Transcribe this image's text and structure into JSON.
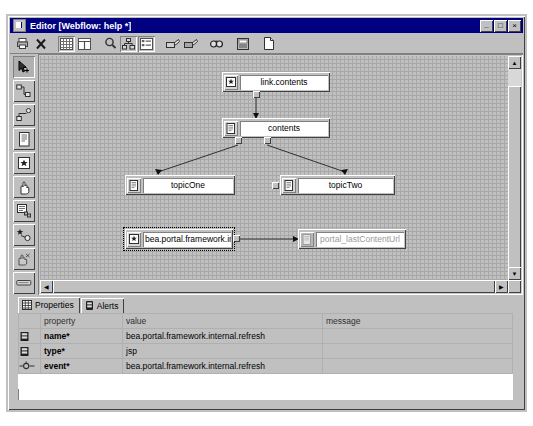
{
  "window": {
    "title": "Editor [Webflow: help *]",
    "icon": "editor-document-icon",
    "buttons": {
      "minimize": "_",
      "maximize": "□",
      "close": "×"
    }
  },
  "toolbar": {
    "items": [
      {
        "name": "print-icon",
        "label": "Print"
      },
      {
        "name": "delete-icon",
        "label": "Delete"
      },
      {
        "name": "show-grid-icon",
        "label": "Show Grid",
        "active": true
      },
      {
        "name": "snap-grid-icon",
        "label": "Snap to Grid",
        "active": false
      },
      {
        "name": "zoom-icon",
        "label": "Zoom"
      },
      {
        "name": "layout-tree-icon",
        "label": "Auto Layout"
      },
      {
        "name": "align-list-icon",
        "label": "Align",
        "active": true
      },
      {
        "name": "new-page-flow-icon",
        "label": "New Page Flow"
      },
      {
        "name": "new-node-icon",
        "label": "New Node"
      },
      {
        "name": "find-icon",
        "label": "Find"
      },
      {
        "name": "properties-icon",
        "label": "Properties"
      },
      {
        "name": "new-file-icon",
        "label": "New File"
      }
    ]
  },
  "palette": {
    "items": [
      {
        "name": "select-tool-icon",
        "label": "Select",
        "active": true
      },
      {
        "name": "action-node-icon",
        "label": "Action"
      },
      {
        "name": "transition-icon",
        "label": "Transition"
      },
      {
        "name": "page-node-icon",
        "label": "Page"
      },
      {
        "name": "begin-node-icon",
        "label": "Begin Action"
      },
      {
        "name": "hand-tool-icon",
        "label": "Pan"
      },
      {
        "name": "stack-node-icon",
        "label": "Stack"
      },
      {
        "name": "star-node-icon",
        "label": "New Event Action"
      },
      {
        "name": "grab-tool-icon",
        "label": "Grab"
      },
      {
        "name": "bar-node-icon",
        "label": "Bar"
      }
    ]
  },
  "canvas": {
    "nodes": [
      {
        "id": "link-contents",
        "label": "link.contents",
        "icon": "star-action-icon",
        "type": "action",
        "selected": false,
        "ghost": false
      },
      {
        "id": "contents",
        "label": "contents",
        "icon": "page-icon",
        "type": "page",
        "selected": false,
        "ghost": false
      },
      {
        "id": "topic-one",
        "label": "topicOne",
        "icon": "page-icon",
        "type": "page",
        "selected": false,
        "ghost": false
      },
      {
        "id": "topic-two",
        "label": "topicTwo",
        "icon": "page-icon",
        "type": "page",
        "selected": false,
        "ghost": false
      },
      {
        "id": "refresh-action",
        "label": "bea.portal.framework.in...",
        "icon": "star-action-icon",
        "type": "action",
        "selected": true,
        "ghost": false
      },
      {
        "id": "last-content",
        "label": "portal_lastContentUrl",
        "icon": "page-icon",
        "type": "page",
        "selected": false,
        "ghost": true
      }
    ],
    "edges": [
      {
        "from": "link-contents",
        "to": "contents"
      },
      {
        "from": "contents",
        "to": "topic-one"
      },
      {
        "from": "contents",
        "to": "topic-two"
      },
      {
        "from": "refresh-action",
        "to": "last-content"
      }
    ]
  },
  "bottom": {
    "tabs": [
      {
        "name": "tab-properties",
        "label": "Properties",
        "icon": "grid-icon",
        "active": true
      },
      {
        "name": "tab-alerts",
        "label": "Alerts",
        "icon": "alert-icon",
        "active": false
      }
    ],
    "table": {
      "headers": [
        "",
        "property",
        "value",
        "message"
      ],
      "rows": [
        {
          "icon": "property-icon",
          "property": "name*",
          "value": "bea.portal.framework.internal.refresh",
          "message": ""
        },
        {
          "icon": "property-icon",
          "property": "type*",
          "value": "jsp",
          "message": ""
        },
        {
          "icon": "event-icon",
          "property": "event*",
          "value": "bea.portal.framework.internal.refresh",
          "message": ""
        }
      ]
    }
  },
  "colors": {
    "titlebar": "#000080",
    "face": "#c0c0c0",
    "canvas_grid": "#a8a8a8",
    "disabled_text": "#9a9a9a"
  }
}
